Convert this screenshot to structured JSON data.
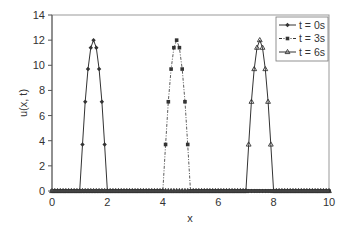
{
  "chart_data": {
    "type": "line",
    "title": "",
    "xlabel": "x",
    "ylabel": "u(x, t)",
    "xlim": [
      0,
      10
    ],
    "ylim": [
      0,
      14
    ],
    "xticks": [
      0,
      2,
      4,
      6,
      8,
      10
    ],
    "yticks": [
      0,
      2,
      4,
      6,
      8,
      10,
      12,
      14
    ],
    "grid": false,
    "legend_position": "top-right",
    "x_step": 0.1,
    "series": [
      {
        "name": "t = 0s",
        "marker": "diamond",
        "line": "solid",
        "pulse_start": 1.0,
        "pulse_end": 2.0,
        "peak": 12,
        "points": [
          [
            1.0,
            0
          ],
          [
            1.1,
            3.7
          ],
          [
            1.2,
            7.1
          ],
          [
            1.3,
            9.7
          ],
          [
            1.4,
            11.4
          ],
          [
            1.5,
            12.0
          ],
          [
            1.6,
            11.4
          ],
          [
            1.7,
            9.7
          ],
          [
            1.8,
            7.1
          ],
          [
            1.9,
            3.7
          ],
          [
            2.0,
            0
          ]
        ]
      },
      {
        "name": "t = 3s",
        "marker": "circle",
        "line": "dashdot",
        "pulse_start": 4.0,
        "pulse_end": 5.0,
        "peak": 12,
        "points": [
          [
            4.0,
            0
          ],
          [
            4.1,
            3.7
          ],
          [
            4.2,
            7.1
          ],
          [
            4.3,
            9.7
          ],
          [
            4.4,
            11.4
          ],
          [
            4.5,
            12.0
          ],
          [
            4.6,
            11.4
          ],
          [
            4.7,
            9.7
          ],
          [
            4.8,
            7.1
          ],
          [
            4.9,
            3.7
          ],
          [
            5.0,
            0
          ]
        ]
      },
      {
        "name": "t = 6s",
        "marker": "triangle",
        "line": "solid",
        "pulse_start": 7.0,
        "pulse_end": 8.0,
        "peak": 12,
        "points": [
          [
            7.0,
            0
          ],
          [
            7.1,
            3.7
          ],
          [
            7.2,
            7.1
          ],
          [
            7.3,
            9.7
          ],
          [
            7.4,
            11.4
          ],
          [
            7.5,
            12.0
          ],
          [
            7.6,
            11.4
          ],
          [
            7.7,
            9.7
          ],
          [
            7.8,
            7.1
          ],
          [
            7.9,
            3.7
          ],
          [
            8.0,
            0
          ]
        ]
      }
    ],
    "baseline_note": "All series are 0 outside their pulse; markers every 0.1 along x from 0 to 10."
  },
  "colors": {
    "line": "#333333",
    "axis": "#555555",
    "text": "#333333"
  }
}
